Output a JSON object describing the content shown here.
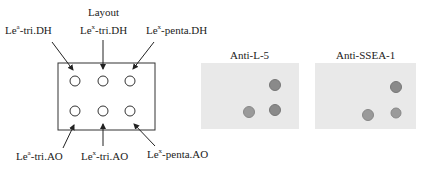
{
  "layout": {
    "title": "Layout",
    "top_labels": [
      {
        "base": "Le",
        "sup": "a",
        "rest": "-tri.DH"
      },
      {
        "base": "Le",
        "sup": "x",
        "rest": "-tri.DH"
      },
      {
        "base": "Le",
        "sup": "x",
        "rest": "-penta.DH"
      }
    ],
    "bottom_labels": [
      {
        "base": "Le",
        "sup": "a",
        "rest": "-tri.AO"
      },
      {
        "base": "Le",
        "sup": "x",
        "rest": "-tri.AO"
      },
      {
        "base": "Le",
        "sup": "x",
        "rest": "-penta.AO"
      }
    ]
  },
  "panels": [
    {
      "title": "Anti-L-5",
      "spots": {
        "top": [
          false,
          false,
          true
        ],
        "bottom": [
          false,
          true,
          true
        ]
      }
    },
    {
      "title": "Anti-SSEA-1",
      "spots": {
        "top": [
          false,
          false,
          true
        ],
        "bottom": [
          false,
          true,
          true
        ]
      }
    }
  ],
  "colors": {
    "spot": "#8a8a8a",
    "panel_bg": "#e9e9e9",
    "line": "#222222"
  }
}
